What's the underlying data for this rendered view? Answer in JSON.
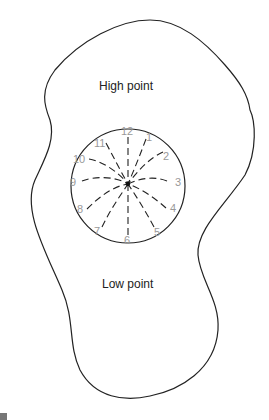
{
  "diagram": {
    "type": "contour-outline-with-clock-face",
    "labels": {
      "high": "High point",
      "low": "Low point"
    },
    "clock": {
      "center": [
        128,
        185
      ],
      "radius": 57,
      "numbers": [
        "12",
        "1",
        "2",
        "3",
        "4",
        "5",
        "6",
        "7",
        "8",
        "9",
        "10",
        "11"
      ],
      "number_color": "#999999",
      "line_style": "dashed",
      "lines_converge_at_center": true
    },
    "colors": {
      "outline": "#222222",
      "text": "#222222",
      "numbers": "#999999",
      "background": "#ffffff"
    }
  }
}
